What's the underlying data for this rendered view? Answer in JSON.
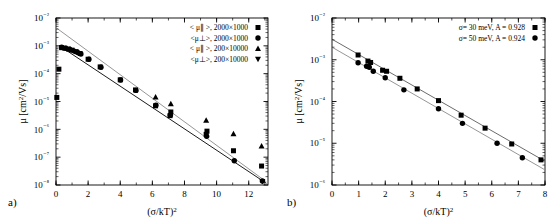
{
  "figure": {
    "width": 558,
    "height": 220,
    "background": "#ffffff",
    "panels": [
      {
        "id": "a",
        "label": "a)"
      },
      {
        "id": "b",
        "label": "b)"
      }
    ]
  },
  "chart_data": [
    {
      "panel": "a",
      "type": "scatter",
      "title": "",
      "xlabel": "(σ/kT)²",
      "ylabel": "μ [cm²/Vs]",
      "xlim": [
        0,
        13.2
      ],
      "ylim": [
        1e-08,
        0.01
      ],
      "yscale": "log",
      "xscale": "linear",
      "grid": false,
      "legend_position": "top-right",
      "xticks": [
        0,
        2,
        4,
        6,
        8,
        10,
        12
      ],
      "xticklabels": [
        "0",
        "2",
        "4",
        "6",
        "8",
        "10",
        "12"
      ],
      "yticks": [
        0.01,
        0.001,
        0.0001,
        1e-05,
        1e-06,
        1e-07,
        1e-08
      ],
      "yticklabels": [
        "10⁻²",
        "10⁻³",
        "10⁻⁴",
        "10⁻⁵",
        "10⁻⁶",
        "10⁻⁷",
        "10⁻⁸"
      ],
      "series": [
        {
          "name": "< μ∥ >, 2000×1000",
          "marker": "square",
          "color": "#000000",
          "points": [
            [
              0.05,
              1.4e-05
            ],
            [
              0.18,
              0.000145
            ],
            [
              0.35,
              0.00086
            ],
            [
              0.55,
              0.00082
            ],
            [
              0.78,
              0.00076
            ],
            [
              1.0,
              0.0007
            ],
            [
              1.25,
              0.00062
            ],
            [
              1.5,
              0.00053
            ],
            [
              2.0,
              0.00033
            ],
            [
              2.75,
              0.000175
            ],
            [
              4.0,
              6e-05
            ],
            [
              4.95,
              2.6e-05
            ],
            [
              6.2,
              7e-06
            ],
            [
              7.1,
              3.1e-06
            ],
            [
              7.15,
              4.2e-06
            ],
            [
              9.35,
              6.6e-07
            ],
            [
              9.4,
              8.6e-07
            ],
            [
              11.05,
              1.7e-07
            ],
            [
              12.8,
              4.8e-08
            ]
          ]
        },
        {
          "name": "<μ⊥>, 2000×1000",
          "marker": "circle",
          "color": "#000000",
          "points": [
            [
              0.35,
              0.00089
            ],
            [
              0.6,
              0.00082
            ],
            [
              0.85,
              0.00075
            ],
            [
              1.1,
              0.00066
            ],
            [
              1.35,
              0.00058
            ],
            [
              1.55,
              0.00051
            ],
            [
              2.05,
              0.00033
            ],
            [
              2.8,
              0.00017
            ],
            [
              4.02,
              5.9e-05
            ],
            [
              4.98,
              2.5e-05
            ],
            [
              6.22,
              7.3e-06
            ],
            [
              7.12,
              3.2e-06
            ],
            [
              9.38,
              5.6e-07
            ],
            [
              11.1,
              7.4e-08
            ],
            [
              12.85,
              1.4e-08
            ]
          ]
        },
        {
          "name": "< μ∥ >, 200×10000",
          "marker": "triangle-up",
          "color": "#000000",
          "points": [
            [
              6.2,
              1.45e-05
            ],
            [
              7.15,
              8.2e-06
            ],
            [
              9.35,
              2.1e-06
            ],
            [
              11.05,
              6.8e-07
            ],
            [
              12.8,
              2.5e-07
            ]
          ]
        },
        {
          "name": "<μ⊥>, 200×10000",
          "marker": "triangle-down",
          "color": "#000000",
          "points": [
            [
              12.85,
              1.35e-08
            ]
          ]
        }
      ],
      "fit_lines": [
        {
          "name": "solid-fit",
          "style": "solid",
          "color": "#000000",
          "x0": 0.35,
          "y0": 0.00089,
          "x1": 13.1,
          "y1": 1.15e-08
        },
        {
          "name": "gray-fit",
          "style": "solid",
          "color": "#8a8a8a",
          "x0": 0.0,
          "y0": 0.0045,
          "x1": 13.1,
          "y1": 1.3e-08
        }
      ]
    },
    {
      "panel": "b",
      "type": "scatter",
      "title": "",
      "xlabel": "(σ/kT)²",
      "ylabel": "μ [cm²/Vs]",
      "xlim": [
        0,
        8
      ],
      "ylim": [
        1e-06,
        0.01
      ],
      "yscale": "log",
      "xscale": "linear",
      "grid": false,
      "legend_position": "top-right",
      "xticks": [
        0,
        1,
        2,
        3,
        4,
        5,
        6,
        7,
        8
      ],
      "xticklabels": [
        "0",
        "1",
        "2",
        "3",
        "4",
        "5",
        "6",
        "7",
        "8"
      ],
      "yticks": [
        0.01,
        0.001,
        0.0001,
        1e-05,
        1e-06
      ],
      "yticklabels": [
        "10⁻²",
        "10⁻³",
        "10⁻⁴",
        "10⁻⁵",
        "10⁻⁶"
      ],
      "series": [
        {
          "name": "σ= 30 meV, A = 0.928",
          "marker": "square",
          "color": "#000000",
          "points": [
            [
              0.98,
              0.0013
            ],
            [
              1.35,
              0.00093
            ],
            [
              1.45,
              0.00086
            ],
            [
              1.9,
              0.00056
            ],
            [
              2.05,
              0.00053
            ],
            [
              2.55,
              0.00036
            ],
            [
              3.2,
              0.0002
            ],
            [
              4.0,
              0.000105
            ],
            [
              4.85,
              4.7e-05
            ],
            [
              5.75,
              2.3e-05
            ],
            [
              6.75,
              9.6e-06
            ],
            [
              7.85,
              4e-06
            ]
          ]
        },
        {
          "name": "σ= 50 meV, A = 0.924",
          "marker": "circle",
          "color": "#000000",
          "points": [
            [
              0.98,
              0.00085
            ],
            [
              1.3,
              0.0007
            ],
            [
              1.4,
              0.00066
            ],
            [
              1.55,
              0.00053
            ],
            [
              2.0,
              0.00037
            ],
            [
              2.7,
              0.00019
            ],
            [
              4.0,
              6.7e-05
            ],
            [
              4.9,
              3e-05
            ],
            [
              6.2,
              1e-05
            ],
            [
              7.15,
              4.5e-06
            ]
          ]
        }
      ],
      "fit_lines": [
        {
          "name": "upper-fit",
          "style": "solid",
          "color": "#5a5a5a",
          "x0": 0.0,
          "y0": 0.0031,
          "x1": 8.0,
          "y1": 3.7e-06
        },
        {
          "name": "lower-fit",
          "style": "solid",
          "color": "#8a8a8a",
          "x0": 0.0,
          "y0": 0.002,
          "x1": 8.0,
          "y1": 2.3e-06
        }
      ]
    }
  ]
}
